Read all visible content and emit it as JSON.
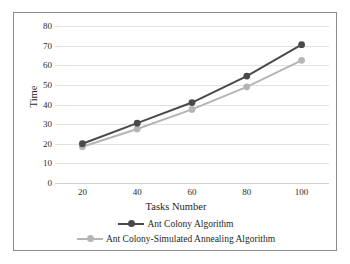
{
  "chart_data": {
    "type": "line",
    "title": "",
    "xlabel": "Tasks Number",
    "ylabel": "Time",
    "x": [
      20,
      40,
      60,
      80,
      100
    ],
    "xticklabels": [
      "20",
      "40",
      "60",
      "80",
      "100"
    ],
    "xlim": [
      10,
      110
    ],
    "ylim": [
      0,
      80
    ],
    "yticks": [
      0,
      10,
      20,
      30,
      40,
      50,
      60,
      70,
      80
    ],
    "yticklabels": [
      "0",
      "10",
      "20",
      "30",
      "40",
      "50",
      "60",
      "70",
      "80"
    ],
    "grid": "horizontal",
    "legend_position": "below-axes",
    "series": [
      {
        "name": "Ant Colony Algorithm",
        "values": [
          20,
          30.5,
          41,
          54.5,
          70.5
        ],
        "color": "#4a4a4a",
        "marker": "circle"
      },
      {
        "name": "Ant Colony-Simulated Annealing Algorithm",
        "values": [
          18.5,
          27.5,
          37.5,
          49,
          62.5
        ],
        "color": "#b5b5b5",
        "marker": "circle"
      }
    ]
  },
  "legend": {
    "items": [
      {
        "label": "Ant Colony Algorithm"
      },
      {
        "label": "Ant Colony-Simulated Annealing Algorithm"
      }
    ]
  },
  "colors": {
    "series_dark": "#4a4a4a",
    "series_light": "#b5b5b5",
    "gridline": "#e2e2e2",
    "border": "#8c8c8c",
    "text": "#1f1f1f",
    "background": "#ffffff"
  }
}
